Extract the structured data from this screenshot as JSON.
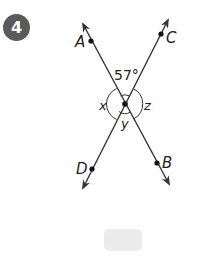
{
  "problem": {
    "number": "4"
  },
  "diagram": {
    "line_color": "#333333",
    "center": {
      "x": 125,
      "y": 104
    },
    "lines": [
      {
        "name": "AB",
        "start": {
          "x": 83,
          "y": 24
        },
        "end": {
          "x": 169,
          "y": 184
        }
      },
      {
        "name": "CD",
        "start": {
          "x": 168,
          "y": 20
        },
        "end": {
          "x": 83,
          "y": 188
        }
      }
    ],
    "points": [
      {
        "label": "A",
        "x": 91,
        "y": 41
      },
      {
        "label": "C",
        "x": 161,
        "y": 34
      },
      {
        "label": "B",
        "x": 157,
        "y": 163
      },
      {
        "label": "D",
        "x": 92,
        "y": 169
      }
    ],
    "angle_labels": {
      "given": "57°",
      "x": "x",
      "y": "y",
      "z": "z"
    }
  },
  "answer_box": {
    "value": ""
  }
}
